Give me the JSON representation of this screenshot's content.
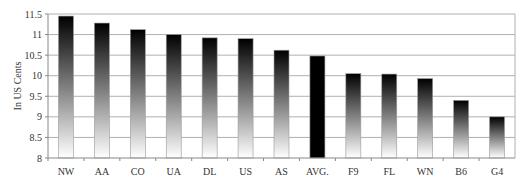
{
  "chart_data": {
    "type": "bar",
    "title": "",
    "xlabel": "",
    "ylabel": "In US Cents",
    "ylim": [
      8,
      11.5
    ],
    "yticks": [
      8,
      8.5,
      9,
      9.5,
      10,
      10.5,
      11,
      11.5
    ],
    "ytick_labels": [
      "8",
      "8.5",
      "9",
      "9.5",
      "10",
      "10.5",
      "11",
      "11.5"
    ],
    "grid": true,
    "legend": null,
    "categories": [
      "NW",
      "AA",
      "CO",
      "UA",
      "DL",
      "US",
      "AS",
      "AVG.",
      "F9",
      "FL",
      "WN",
      "B6",
      "G4"
    ],
    "values": [
      11.45,
      11.28,
      11.12,
      11.0,
      10.92,
      10.9,
      10.62,
      10.48,
      10.05,
      10.04,
      9.93,
      9.4,
      9.0
    ],
    "highlight": {
      "category": "AVG.",
      "style": "solid-black"
    },
    "bar_style": "vertical gradient black (top) to white (bottom)"
  },
  "colors": {
    "grid": "#b0b0b0",
    "axis": "#888888",
    "bar_top": "#000000",
    "bar_bottom": "#ffffff",
    "avg_bar": "#000000",
    "text": "#333333"
  }
}
